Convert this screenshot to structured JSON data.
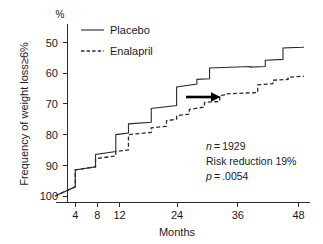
{
  "chart_data": {
    "type": "line",
    "title": "",
    "subtitle": "",
    "xlabel": "Months",
    "ylabel": "Frequency of weight loss≥6%",
    "yunit": "%",
    "xlim": [
      0,
      50
    ],
    "ylim": [
      100,
      46
    ],
    "y_inverted": true,
    "grid": false,
    "legend_position": "top-left",
    "xticks": [
      4,
      8,
      12,
      24,
      36,
      48
    ],
    "xtick_labels": [
      "4",
      "8",
      "12",
      "24",
      "36",
      "48"
    ],
    "yticks": [
      50,
      60,
      70,
      80,
      90,
      100
    ],
    "ytick_labels": [
      "50",
      "60",
      "70",
      "80",
      "90",
      "100"
    ],
    "series": [
      {
        "name": "Placebo",
        "style": "solid",
        "step": true,
        "points": [
          [
            0,
            100
          ],
          [
            4,
            97
          ],
          [
            4,
            91.5
          ],
          [
            8,
            90.5
          ],
          [
            8,
            86.5
          ],
          [
            12,
            85.5
          ],
          [
            12,
            80.0
          ],
          [
            14.5,
            79.5
          ],
          [
            14.5,
            76.5
          ],
          [
            19,
            76.0
          ],
          [
            19,
            71.5
          ],
          [
            24,
            70.5
          ],
          [
            24,
            64.5
          ],
          [
            28,
            63.5
          ],
          [
            28,
            62.0
          ],
          [
            30.5,
            61.8
          ],
          [
            30.5,
            58.3
          ],
          [
            38.5,
            57.8
          ],
          [
            38.5,
            58.0
          ],
          [
            41.5,
            57.8
          ],
          [
            41.5,
            55.8
          ],
          [
            45,
            55.5
          ],
          [
            45,
            51.8
          ],
          [
            49,
            51.5
          ],
          [
            49,
            51.3
          ]
        ]
      },
      {
        "name": "Enalapril",
        "style": "dashed",
        "step": true,
        "points": [
          [
            0,
            100
          ],
          [
            4,
            97
          ],
          [
            4,
            91.5
          ],
          [
            8,
            90.5
          ],
          [
            8,
            87.8
          ],
          [
            12,
            87.0
          ],
          [
            12,
            85.5
          ],
          [
            14.5,
            85.0
          ],
          [
            14.5,
            80.0
          ],
          [
            19,
            79.3
          ],
          [
            19,
            77.8
          ],
          [
            22,
            77.3
          ],
          [
            22,
            75.5
          ],
          [
            24,
            75.0
          ],
          [
            24,
            73.8
          ],
          [
            26.5,
            73.3
          ],
          [
            26.5,
            71.8
          ],
          [
            29.5,
            71.0
          ],
          [
            29.5,
            69.5
          ],
          [
            32.5,
            69.2
          ],
          [
            32.5,
            67.3
          ],
          [
            34,
            67.0
          ],
          [
            34,
            66.7
          ],
          [
            40,
            66.3
          ],
          [
            40,
            63.8
          ],
          [
            43,
            63.4
          ],
          [
            43,
            62.3
          ],
          [
            46,
            62.0
          ],
          [
            46,
            61.3
          ],
          [
            49,
            61.0
          ],
          [
            49,
            60.8
          ]
        ]
      }
    ],
    "annotations": [
      {
        "id": "n-value",
        "text": "n = 1929"
      },
      {
        "id": "risk-reduction",
        "text": "Risk reduction 19%"
      },
      {
        "id": "p-value",
        "text": "p = .0054"
      }
    ],
    "arrow": {
      "id": "risk-gap-arrow",
      "label": "horizontal arrow from placebo curve to enalapril curve",
      "x_start": 26.0,
      "x_end": 32.5,
      "y": 72.0
    },
    "colors": {
      "placebo": "#2b2b2b",
      "enalapril": "#2b2b2b",
      "arrow": "#000000",
      "axis": "#2b2b2b",
      "background": "#ffffff"
    }
  },
  "legend": {
    "items": [
      {
        "label": "Placebo",
        "style": "solid"
      },
      {
        "label": "Enalapril",
        "style": "dashed"
      }
    ]
  },
  "annotation_lines": {
    "line1": "n = 1929",
    "line1_italic": "n",
    "line1_rest": " = 1929",
    "line2": "Risk reduction 19%",
    "line3_italic": "p",
    "line3_rest": " = .0054"
  }
}
